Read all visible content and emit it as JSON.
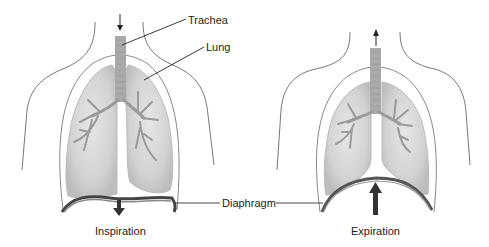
{
  "diagram": {
    "labels": {
      "trachea": "Trachea",
      "lung": "Lung",
      "diaphragm": "Diaphragm",
      "inspiration": "Inspiration",
      "expiration": "Expiration"
    },
    "panels": [
      {
        "name": "inspiration",
        "airflow": "down",
        "diaphragm_motion": "down"
      },
      {
        "name": "expiration",
        "airflow": "up",
        "diaphragm_motion": "up"
      }
    ],
    "colors": {
      "outline": "#666666",
      "lung_fill": "#d4d4d4",
      "lung_edge": "#bdbdbd",
      "bronchi": "#9a9a9a",
      "trachea": "#a8a8a8",
      "diaphragm": "#555555",
      "arrow": "#333333",
      "text": "#222222"
    }
  }
}
